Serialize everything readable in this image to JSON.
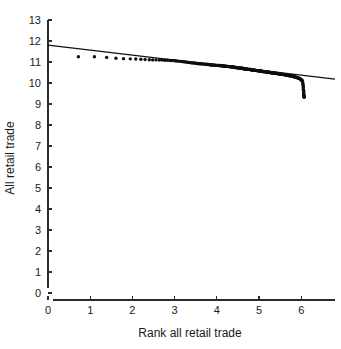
{
  "chart_data": {
    "type": "scatter",
    "title": "",
    "xlabel": "Rank all retail trade",
    "ylabel": "All retail trade",
    "xlim": [
      0,
      6.8
    ],
    "ylim": [
      0,
      13
    ],
    "xticks": [
      0,
      1,
      2,
      3,
      4,
      5,
      6
    ],
    "yticks": [
      0,
      1,
      2,
      3,
      4,
      5,
      6,
      7,
      8,
      9,
      10,
      11,
      12,
      13
    ],
    "xtick_labels": [
      "0",
      "1",
      "2",
      "3",
      "4",
      "5",
      "6"
    ],
    "ytick_labels": [
      "0",
      "1",
      "2",
      "3",
      "4",
      "5",
      "6",
      "7",
      "8",
      "9",
      "10",
      "11",
      "12",
      "13"
    ],
    "grid": false,
    "legend": false,
    "marker": "filled-circle",
    "marker_color": "#0d0d0d",
    "line_color": "#111111",
    "axis_color": "#2b2b2b",
    "background": "#ffffff",
    "series": [
      {
        "name": "Rank-size scatter",
        "type": "scatter",
        "x": [
          0.72,
          1.1,
          1.39,
          1.61,
          1.79,
          1.95,
          2.08,
          2.2,
          2.3,
          2.4,
          2.48,
          2.56,
          2.64,
          2.71,
          2.77,
          2.83,
          2.89,
          2.94,
          3.0,
          3.04,
          3.09,
          3.14,
          3.18,
          3.22,
          3.26,
          3.3,
          3.33,
          3.37,
          3.4,
          3.43,
          3.47,
          3.5,
          3.53,
          3.56,
          3.58,
          3.61,
          3.64,
          3.66,
          3.69,
          3.71,
          3.74,
          3.76,
          3.78,
          3.81,
          3.83,
          3.85,
          3.87,
          3.89,
          3.91,
          3.93,
          3.95,
          3.97,
          3.99,
          4.01,
          4.03,
          4.04,
          4.06,
          4.08,
          4.09,
          4.11,
          4.13,
          4.14,
          4.16,
          4.17,
          4.19,
          4.2,
          4.22,
          4.23,
          4.25,
          4.26,
          4.28,
          4.29,
          4.3,
          4.32,
          4.33,
          4.34,
          4.36,
          4.37,
          4.38,
          4.39,
          4.41,
          4.42,
          4.43,
          4.44,
          4.45,
          4.47,
          4.48,
          4.49,
          4.5,
          4.51,
          4.52,
          4.53,
          4.55,
          4.56,
          4.57,
          4.58,
          4.59,
          4.6,
          4.61,
          4.62,
          4.63,
          4.64,
          4.65,
          4.66,
          4.67,
          4.68,
          4.69,
          4.7,
          4.71,
          4.72,
          4.73,
          4.74,
          4.75,
          4.76,
          4.77,
          4.78,
          4.79,
          4.8,
          4.81,
          4.82,
          4.83,
          4.84,
          4.85,
          4.86,
          4.87,
          4.88,
          4.89,
          4.9,
          4.91,
          4.92,
          4.93,
          4.94,
          4.95,
          4.96,
          4.97,
          4.98,
          4.99,
          5.0,
          5.01,
          5.02,
          5.03,
          5.04,
          5.05,
          5.06,
          5.07,
          5.08,
          5.09,
          5.1,
          5.11,
          5.12,
          5.13,
          5.14,
          5.15,
          5.16,
          5.17,
          5.18,
          5.19,
          5.2,
          5.21,
          5.22,
          5.23,
          5.24,
          5.25,
          5.26,
          5.27,
          5.28,
          5.29,
          5.3,
          5.31,
          5.32,
          5.33,
          5.34,
          5.35,
          5.36,
          5.37,
          5.38,
          5.39,
          5.4,
          5.41,
          5.42,
          5.43,
          5.44,
          5.45,
          5.46,
          5.47,
          5.48,
          5.49,
          5.5,
          5.51,
          5.52,
          5.53,
          5.54,
          5.55,
          5.56,
          5.57,
          5.58,
          5.59,
          5.6,
          5.61,
          5.62,
          5.63,
          5.64,
          5.65,
          5.66,
          5.67,
          5.68,
          5.69,
          5.7,
          5.71,
          5.72,
          5.73,
          5.74,
          5.75,
          5.76,
          5.77,
          5.78,
          5.79,
          5.8,
          5.81,
          5.82,
          5.83,
          5.84,
          5.85,
          5.86,
          5.87,
          5.88,
          5.89,
          5.9,
          5.91,
          5.92,
          5.93,
          5.94,
          5.95,
          5.96,
          5.97,
          5.98,
          5.99,
          6.0,
          6.01,
          6.02,
          6.03,
          6.03,
          6.04,
          6.04,
          6.05,
          6.05,
          6.05,
          6.06,
          6.06,
          6.06,
          6.06,
          6.07,
          6.07,
          6.07,
          6.07,
          6.07
        ],
        "y": [
          11.25,
          11.25,
          11.22,
          11.18,
          11.16,
          11.15,
          11.14,
          11.13,
          11.12,
          11.11,
          11.1,
          11.1,
          11.09,
          11.09,
          11.08,
          11.08,
          11.07,
          11.07,
          11.06,
          11.05,
          11.04,
          11.03,
          11.02,
          11.01,
          11.0,
          10.99,
          10.98,
          10.97,
          10.96,
          10.95,
          10.95,
          10.94,
          10.93,
          10.93,
          10.92,
          10.92,
          10.91,
          10.91,
          10.9,
          10.9,
          10.89,
          10.89,
          10.88,
          10.88,
          10.87,
          10.87,
          10.86,
          10.86,
          10.86,
          10.85,
          10.85,
          10.85,
          10.84,
          10.84,
          10.84,
          10.83,
          10.83,
          10.83,
          10.82,
          10.82,
          10.82,
          10.81,
          10.81,
          10.81,
          10.8,
          10.8,
          10.8,
          10.79,
          10.79,
          10.79,
          10.78,
          10.78,
          10.78,
          10.77,
          10.77,
          10.77,
          10.76,
          10.76,
          10.76,
          10.75,
          10.75,
          10.75,
          10.74,
          10.74,
          10.74,
          10.73,
          10.73,
          10.73,
          10.72,
          10.72,
          10.72,
          10.72,
          10.71,
          10.71,
          10.71,
          10.7,
          10.7,
          10.7,
          10.69,
          10.69,
          10.69,
          10.68,
          10.68,
          10.68,
          10.68,
          10.67,
          10.67,
          10.67,
          10.66,
          10.66,
          10.66,
          10.65,
          10.65,
          10.65,
          10.65,
          10.64,
          10.64,
          10.64,
          10.63,
          10.63,
          10.63,
          10.62,
          10.62,
          10.62,
          10.62,
          10.61,
          10.61,
          10.61,
          10.6,
          10.6,
          10.6,
          10.59,
          10.59,
          10.59,
          10.59,
          10.58,
          10.58,
          10.58,
          10.57,
          10.57,
          10.57,
          10.57,
          10.56,
          10.56,
          10.56,
          10.55,
          10.55,
          10.55,
          10.54,
          10.54,
          10.54,
          10.54,
          10.53,
          10.53,
          10.53,
          10.52,
          10.52,
          10.52,
          10.52,
          10.51,
          10.51,
          10.51,
          10.5,
          10.5,
          10.5,
          10.5,
          10.49,
          10.49,
          10.49,
          10.48,
          10.48,
          10.48,
          10.48,
          10.47,
          10.47,
          10.47,
          10.46,
          10.46,
          10.46,
          10.45,
          10.45,
          10.45,
          10.45,
          10.44,
          10.44,
          10.44,
          10.43,
          10.43,
          10.43,
          10.42,
          10.42,
          10.42,
          10.41,
          10.41,
          10.41,
          10.4,
          10.4,
          10.4,
          10.39,
          10.39,
          10.39,
          10.38,
          10.38,
          10.38,
          10.37,
          10.37,
          10.36,
          10.36,
          10.36,
          10.35,
          10.35,
          10.34,
          10.34,
          10.34,
          10.33,
          10.33,
          10.32,
          10.32,
          10.31,
          10.31,
          10.3,
          10.3,
          10.29,
          10.29,
          10.28,
          10.27,
          10.27,
          10.26,
          10.25,
          10.25,
          10.24,
          10.23,
          10.22,
          10.21,
          10.2,
          10.19,
          10.17,
          10.16,
          10.14,
          10.12,
          10.1,
          10.05,
          10.0,
          9.93,
          9.86,
          9.78,
          9.7,
          9.62,
          9.55,
          9.49,
          9.44,
          9.4,
          9.37,
          9.35,
          9.33,
          9.32
        ]
      },
      {
        "name": "Fitted line",
        "type": "line",
        "x": [
          0.0,
          6.8
        ],
        "y": [
          11.8,
          10.18
        ]
      }
    ]
  },
  "axes": {
    "ylabel": "All retail trade",
    "xlabel": "Rank all retail trade"
  }
}
